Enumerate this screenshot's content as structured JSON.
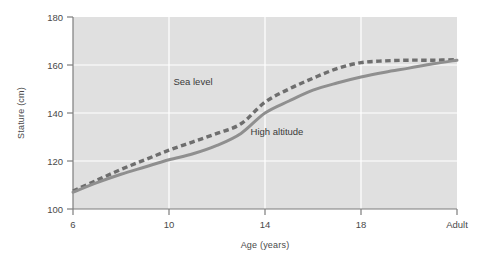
{
  "chart_data": {
    "type": "line",
    "title": "",
    "xlabel": "Age (years)",
    "ylabel": "Stature (cm)",
    "xlim": [
      6,
      22
    ],
    "ylim": [
      100,
      180
    ],
    "xticks": [
      "6",
      "10",
      "14",
      "18",
      "Adult"
    ],
    "xtick_values": [
      6,
      10,
      14,
      18,
      22
    ],
    "yticks": [
      "100",
      "120",
      "140",
      "160",
      "180"
    ],
    "ytick_values": [
      100,
      120,
      140,
      160,
      180
    ],
    "grid": "white gridlines on gray plot background",
    "legend": "inline labels on curves",
    "plot_background": "#e0e0e0",
    "grid_color": "#ffffff",
    "series": [
      {
        "name": "Sea level",
        "style": "dashed",
        "color": "#6e6e6e",
        "label_x": 11.0,
        "label_y": 151.5,
        "x": [
          6,
          7,
          8,
          9,
          10,
          11,
          12,
          13,
          14,
          15,
          16,
          17,
          18,
          19,
          20,
          21,
          22
        ],
        "values": [
          107.5,
          112.0,
          116.5,
          120.5,
          124.5,
          128.0,
          131.5,
          135.5,
          144.5,
          150.0,
          154.5,
          158.5,
          161.0,
          161.7,
          162.0,
          162.0,
          162.2
        ]
      },
      {
        "name": "High altitude",
        "style": "solid",
        "color": "#8f8f8f",
        "label_x": 14.5,
        "label_y": 131.0,
        "x": [
          6,
          7,
          8,
          9,
          10,
          11,
          12,
          13,
          14,
          15,
          16,
          17,
          18,
          19,
          20,
          21,
          22
        ],
        "values": [
          107.0,
          111.0,
          114.5,
          117.5,
          120.5,
          123.0,
          126.5,
          131.5,
          140.0,
          145.0,
          149.5,
          152.5,
          155.0,
          157.0,
          158.7,
          160.5,
          162.0
        ]
      }
    ]
  }
}
